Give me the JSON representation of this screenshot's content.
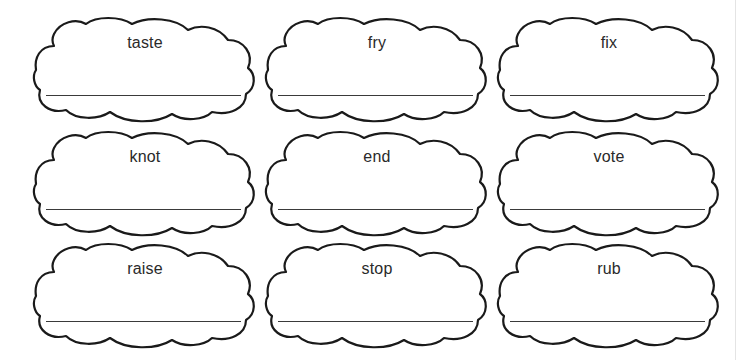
{
  "worksheet": {
    "rows": [
      {
        "cards": [
          {
            "word": "taste"
          },
          {
            "word": "fry"
          },
          {
            "word": "fix"
          }
        ]
      },
      {
        "cards": [
          {
            "word": "knot"
          },
          {
            "word": "end"
          },
          {
            "word": "vote"
          }
        ]
      },
      {
        "cards": [
          {
            "word": "raise"
          },
          {
            "word": "stop"
          },
          {
            "word": "rub"
          }
        ]
      }
    ],
    "colors": {
      "outline": "#1a1a1a",
      "text": "#2a2a2a",
      "line": "#3a3a3a",
      "background": "#ffffff"
    }
  }
}
